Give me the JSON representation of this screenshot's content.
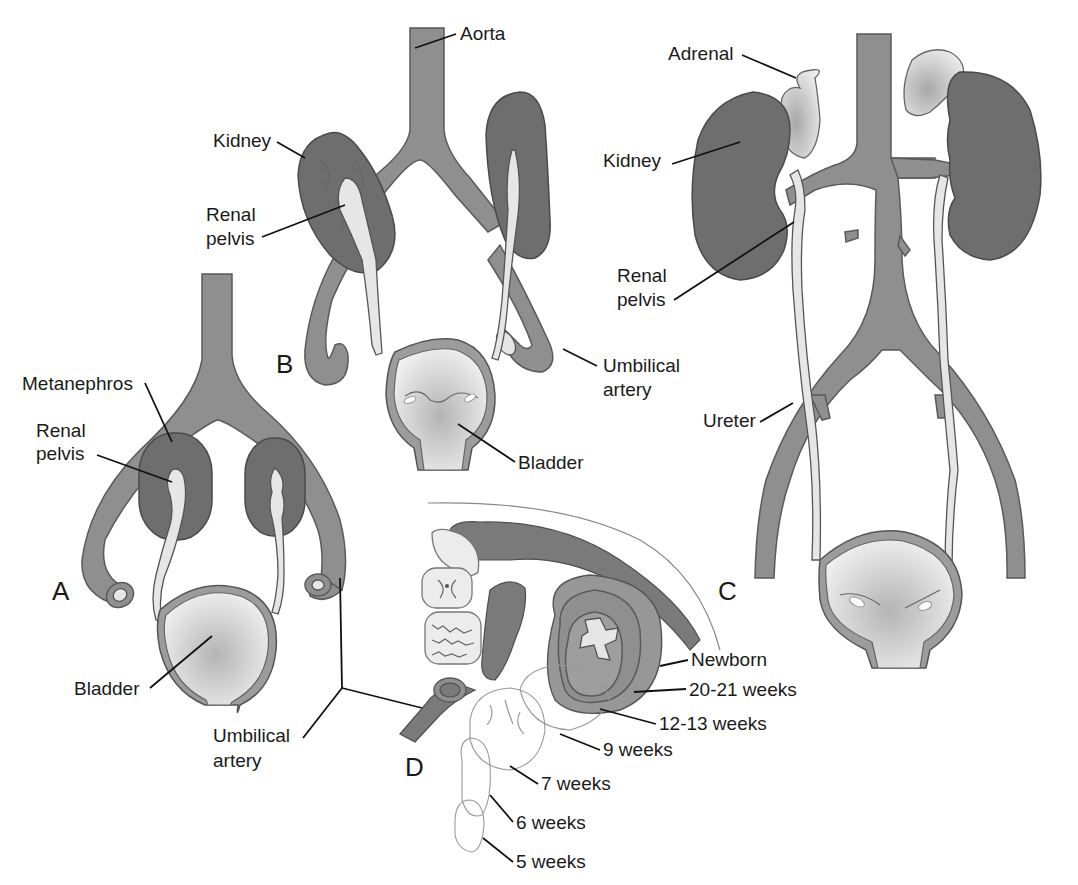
{
  "figure": {
    "colors": {
      "vessel": "#8f8f8f",
      "kidney": "#6e6e6e",
      "pelvis_ureter": "#e6e6e6",
      "adrenal": "#d2d2d2",
      "outline": "#555555",
      "text": "#1a1a1a"
    },
    "panels": {
      "A": {
        "letter": "A",
        "labels": {
          "metanephros": "Metanephros",
          "renal_pelvis_line1": "Renal",
          "renal_pelvis_line2": "pelvis",
          "bladder": "Bladder",
          "umbilical_line1": "Umbilical",
          "umbilical_line2": "artery"
        }
      },
      "B": {
        "letter": "B",
        "labels": {
          "aorta": "Aorta",
          "kidney": "Kidney",
          "renal_pelvis_line1": "Renal",
          "renal_pelvis_line2": "pelvis",
          "umbilical_line1": "Umbilical",
          "umbilical_line2": "artery",
          "bladder": "Bladder"
        }
      },
      "C": {
        "letter": "C",
        "labels": {
          "adrenal": "Adrenal",
          "kidney": "Kidney",
          "renal_pelvis_line1": "Renal",
          "renal_pelvis_line2": "pelvis",
          "ureter": "Ureter"
        }
      },
      "D": {
        "letter": "D",
        "stages": [
          "Newborn",
          "20-21 weeks",
          "12-13 weeks",
          "9 weeks",
          "7 weeks",
          "6 weeks",
          "5 weeks"
        ]
      }
    }
  }
}
